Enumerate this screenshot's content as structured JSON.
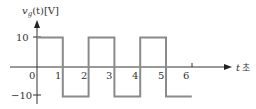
{
  "chart_data": {
    "type": "line",
    "title": "",
    "ylabel": "v_g(t)[V]",
    "ylabel_parts": {
      "main": "v",
      "sub": "g",
      "rest": "(t)[V]"
    },
    "xlabel": "t 초",
    "xlabel_parts": {
      "var": "t",
      "unit": "초"
    },
    "xlim": [
      0,
      6.5
    ],
    "ylim": [
      -10,
      10
    ],
    "x_ticks": [
      "0",
      "1",
      "2",
      "3",
      "4",
      "5",
      "6"
    ],
    "y_ticks": [
      "10",
      "−10"
    ],
    "grid": false,
    "series": [
      {
        "name": "v_g(t)",
        "step": true,
        "x": [
          0,
          1,
          1,
          2,
          2,
          3,
          3,
          4,
          4,
          5,
          5,
          6
        ],
        "values": [
          10,
          10,
          -10,
          -10,
          10,
          10,
          -10,
          -10,
          10,
          10,
          -10,
          -10
        ]
      }
    ],
    "colors": {
      "waveform": "#8a8a8a",
      "axes": "#333333"
    }
  }
}
